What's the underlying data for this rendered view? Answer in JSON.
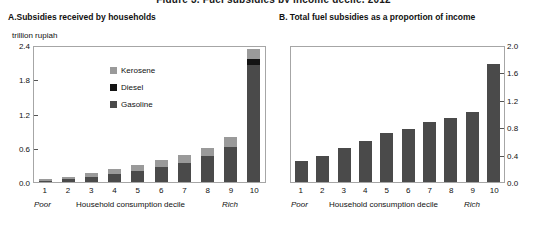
{
  "figure": {
    "title": "Figure 3.  Fuel subsidies by income decile, 2012"
  },
  "panelA": {
    "title": "A.Subsidies received by households",
    "unit": "trillion rupiah",
    "poor_label": "Poor",
    "rich_label": "Rich",
    "axis_caption": "Household consumption decile",
    "legend": [
      {
        "name": "Kerosene",
        "color": "#9a9a9a"
      },
      {
        "name": "Diesel",
        "color": "#141414"
      },
      {
        "name": "Gasoline",
        "color": "#4a4a4a"
      }
    ]
  },
  "panelB": {
    "title": "B. Total fuel subsidies as a proportion of income",
    "poor_label": "Poor",
    "rich_label": "Rich",
    "axis_caption": "Household consumption decile"
  },
  "chart_data": [
    {
      "type": "bar",
      "stacked": true,
      "panel": "A",
      "title": "A.Subsidies received by households",
      "xlabel": "Household consumption decile",
      "ylabel": "trillion rupiah",
      "ylim": [
        0,
        2.4
      ],
      "yticks": [
        0.0,
        0.6,
        1.2,
        1.8,
        2.4
      ],
      "ytick_labels": [
        "0.0",
        "0.6",
        "1.2",
        "1.8",
        "2.4"
      ],
      "grid": false,
      "legend_position": "inside-upper-center",
      "categories": [
        "1",
        "2",
        "3",
        "4",
        "5",
        "6",
        "7",
        "8",
        "9",
        "10"
      ],
      "series": [
        {
          "name": "Gasoline",
          "color": "#4a4a4a",
          "values": [
            0.02,
            0.05,
            0.09,
            0.14,
            0.2,
            0.26,
            0.34,
            0.45,
            0.62,
            2.05
          ]
        },
        {
          "name": "Diesel",
          "color": "#141414",
          "values": [
            0.0,
            0.0,
            0.0,
            0.0,
            0.0,
            0.0,
            0.0,
            0.0,
            0.0,
            0.11
          ]
        },
        {
          "name": "Kerosene",
          "color": "#9a9a9a",
          "values": [
            0.03,
            0.04,
            0.06,
            0.08,
            0.1,
            0.12,
            0.13,
            0.14,
            0.16,
            0.17
          ]
        }
      ],
      "totals": [
        0.05,
        0.09,
        0.15,
        0.22,
        0.3,
        0.38,
        0.47,
        0.59,
        0.78,
        2.33
      ]
    },
    {
      "type": "bar",
      "stacked": false,
      "panel": "B",
      "title": "B. Total fuel subsidies as a proportion of income",
      "xlabel": "Household consumption decile",
      "ylabel": "",
      "ylim": [
        0,
        2.0
      ],
      "yticks": [
        0.0,
        0.4,
        0.8,
        1.2,
        1.6,
        2.0
      ],
      "ytick_labels": [
        "0.0",
        "0.4",
        "0.8",
        "1.2",
        "1.6",
        "2.0"
      ],
      "grid": false,
      "legend_position": "none",
      "categories": [
        "1",
        "2",
        "3",
        "4",
        "5",
        "6",
        "7",
        "8",
        "9",
        "10"
      ],
      "values": [
        0.31,
        0.38,
        0.5,
        0.6,
        0.72,
        0.78,
        0.88,
        0.94,
        1.02,
        1.72
      ],
      "color": "#4a4a4a"
    }
  ]
}
